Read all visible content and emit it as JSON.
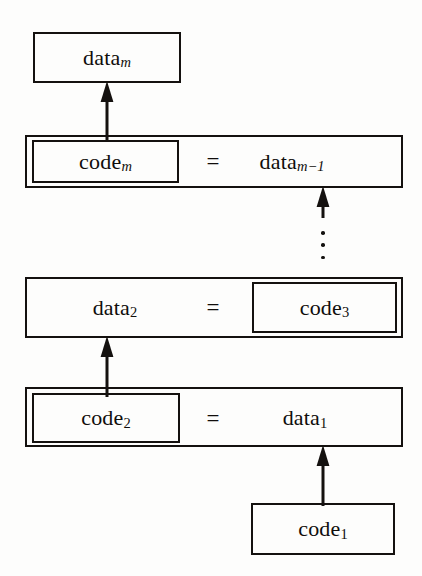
{
  "diagram": {
    "type": "block-diagram",
    "ink_color": "#14110f",
    "background_color": "#fdfdfc",
    "nodes": [
      {
        "id": "data_m",
        "base": "data",
        "sub": "m",
        "sub_style": "italic",
        "text": "datam"
      },
      {
        "id": "code_m",
        "base": "code",
        "sub": "m",
        "sub_style": "italic",
        "text": "codem"
      },
      {
        "id": "data_m_1",
        "base": "data",
        "sub": "m−1",
        "sub_style": "italic",
        "text": "datam−1"
      },
      {
        "id": "data_2",
        "base": "data",
        "sub": "2",
        "sub_style": "upright",
        "text": "data2"
      },
      {
        "id": "code_3",
        "base": "code",
        "sub": "3",
        "sub_style": "upright",
        "text": "code3"
      },
      {
        "id": "code_2",
        "base": "code",
        "sub": "2",
        "sub_style": "upright",
        "text": "code2"
      },
      {
        "id": "data_1",
        "base": "data",
        "sub": "1",
        "sub_style": "upright",
        "text": "data1"
      },
      {
        "id": "code_1",
        "base": "code",
        "sub": "1",
        "sub_style": "upright",
        "text": "code1"
      }
    ],
    "equals": "=",
    "ellipsis": "⋮",
    "rows": [
      {
        "id": "row-1",
        "label": "data_m block"
      },
      {
        "id": "row-2",
        "label": "code_m = data_m-1 block"
      },
      {
        "id": "row-3",
        "label": "data_2 = code_3 block"
      },
      {
        "id": "row-4",
        "label": "code_2 = data_1 block"
      },
      {
        "id": "row-5",
        "label": "code_1 block"
      }
    ],
    "arrows": [
      {
        "id": "arrow-code_m-to-data_m",
        "from": "code_m",
        "to": "data_m"
      },
      {
        "id": "arrow-chain-to-data_m_1",
        "from": "ellipsis",
        "to": "data_m_1"
      },
      {
        "id": "arrow-code_3-to-data_2",
        "from": "code_3",
        "to": "data_2"
      },
      {
        "id": "arrow-code_1-to-data_1",
        "from": "code_1",
        "to": "data_1"
      }
    ]
  }
}
